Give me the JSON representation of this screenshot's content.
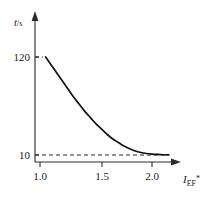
{
  "chart_data": {
    "type": "line",
    "title": "",
    "subtitle": "",
    "xlabel": "I_EF*",
    "xlabel_main": "I",
    "xlabel_sub": "EF",
    "xlabel_sup": "*",
    "ylabel": "t/s",
    "ylabel_main": "t",
    "ylabel_unit": "/s",
    "xlim": [
      1.0,
      2.2
    ],
    "ylim": [
      0,
      135
    ],
    "xticks": [
      1.0,
      1.5,
      2.0
    ],
    "xtick_labels": [
      "1.0",
      "1.5",
      "2.0"
    ],
    "yticks": [
      10,
      120
    ],
    "ytick_labels": [
      "10",
      "120"
    ],
    "grid": false,
    "legend": null,
    "legend_position": "none",
    "axis_arrows": true,
    "curve_color": "#111111",
    "axis_color": "#2b2b2b",
    "background_color": "#ffffff",
    "annotations": [
      {
        "name": "upper-asymptote-guide",
        "kind": "dashed-horizontal",
        "y": 120,
        "x_start": 1.0,
        "x_end": 1.06
      },
      {
        "name": "lower-asymptote-guide",
        "kind": "dashed-horizontal",
        "y": 10,
        "x_start": 1.0,
        "x_end": 2.15
      }
    ],
    "series": [
      {
        "name": "decay-curve",
        "x": [
          1.05,
          1.1,
          1.15,
          1.2,
          1.25,
          1.3,
          1.35,
          1.4,
          1.45,
          1.5,
          1.55,
          1.6,
          1.65,
          1.7,
          1.75,
          1.8,
          1.85,
          1.9,
          1.95,
          2.0,
          2.05,
          2.1,
          2.15
        ],
        "values": [
          120,
          111,
          102,
          93,
          84,
          75,
          67,
          59,
          52,
          45,
          39,
          33,
          28,
          24,
          20,
          17,
          14.5,
          12.8,
          11.7,
          11.0,
          10.6,
          10.3,
          10.1
        ]
      }
    ]
  }
}
